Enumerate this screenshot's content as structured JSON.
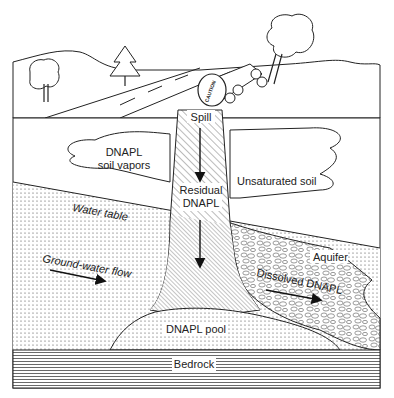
{
  "diagram": {
    "labels": {
      "spill": "Spill",
      "soil_vapors_line1": "DNAPL",
      "soil_vapors_line2": "soil vapors",
      "residual_line1": "Residual",
      "residual_line2": "DNAPL",
      "unsaturated_soil": "Unsaturated soil",
      "water_table": "Water table",
      "groundwater_flow": "Ground-water flow",
      "aquifer": "Aquifer",
      "dissolved": "Dissolved DNAPL",
      "pool": "DNAPL pool",
      "bedrock": "Bedrock",
      "caution": "CAUTION"
    },
    "layers": [
      "Surface landscape",
      "Unsaturated soil",
      "Aquifer (saturated zone)",
      "Bedrock"
    ],
    "colors": {
      "ink": "#222222",
      "background": "#ffffff"
    }
  }
}
